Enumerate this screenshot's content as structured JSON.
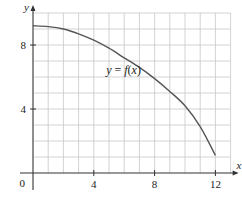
{
  "chart_data": {
    "type": "line",
    "title": "",
    "xlabel": "x",
    "ylabel": "y",
    "xlim": [
      0,
      13
    ],
    "ylim": [
      0,
      10
    ],
    "grid": true,
    "x_ticks": [
      0,
      4,
      8,
      12
    ],
    "y_ticks": [
      4,
      8
    ],
    "origin_label": "0",
    "series": [
      {
        "name": "y = f(x)",
        "x": [
          0,
          1,
          2,
          3,
          4,
          5,
          6,
          7,
          8,
          9,
          10,
          11,
          12
        ],
        "values": [
          9.2,
          9.15,
          9.0,
          8.7,
          8.3,
          7.8,
          7.2,
          6.6,
          5.9,
          5.1,
          4.2,
          2.9,
          1.1
        ]
      }
    ],
    "annotations": [
      {
        "text": "y = f(x)",
        "x": 5.8,
        "y": 6.2
      }
    ]
  },
  "colors": {
    "grid": "#c8c8c8",
    "axis": "#333333",
    "curve": "#555555"
  }
}
